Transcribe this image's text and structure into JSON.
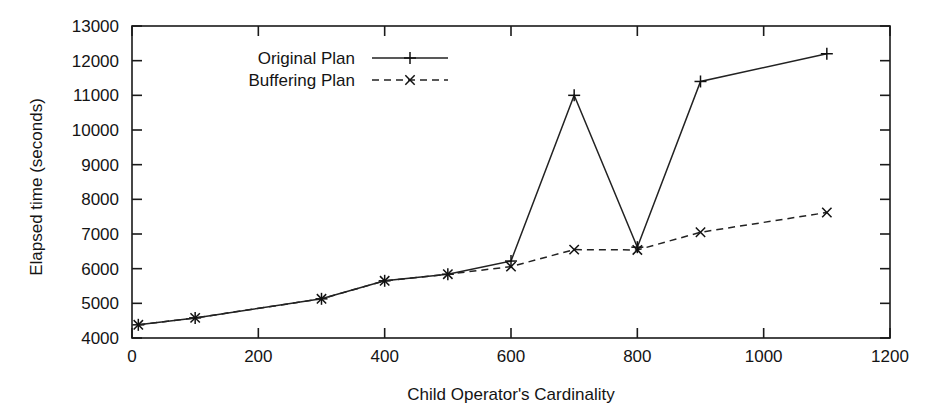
{
  "chart_data": {
    "type": "line",
    "title": "",
    "xlabel": "Child Operator's Cardinality",
    "ylabel": "Elapsed time (seconds)",
    "xlim": [
      0,
      1200
    ],
    "ylim": [
      4000,
      13000
    ],
    "xticks": [
      0,
      200,
      400,
      600,
      800,
      1000,
      1200
    ],
    "xtick_labels": [
      "0",
      "200",
      "400",
      "600",
      "800",
      "1000",
      "1200"
    ],
    "yticks": [
      4000,
      5000,
      6000,
      7000,
      8000,
      9000,
      10000,
      11000,
      12000,
      13000
    ],
    "ytick_labels": [
      "4000",
      "5000",
      "6000",
      "7000",
      "8000",
      "9000",
      "10000",
      "11000",
      "12000",
      "13000"
    ],
    "grid": false,
    "legend_position": "top-center",
    "series": [
      {
        "name": "Original Plan",
        "marker": "plus",
        "linestyle": "solid",
        "color": "#222222",
        "x": [
          10,
          100,
          300,
          400,
          500,
          600,
          700,
          800,
          900,
          1100
        ],
        "values": [
          4380,
          4580,
          5130,
          5650,
          5840,
          6220,
          11000,
          6620,
          11400,
          12200
        ]
      },
      {
        "name": "Buffering Plan",
        "marker": "cross",
        "linestyle": "dashed",
        "color": "#222222",
        "x": [
          10,
          100,
          300,
          400,
          500,
          600,
          700,
          800,
          900,
          1100
        ],
        "values": [
          4380,
          4580,
          5130,
          5650,
          5840,
          6060,
          6550,
          6540,
          7050,
          7620
        ]
      }
    ]
  },
  "legend": {
    "entries": [
      {
        "label": "Original Plan"
      },
      {
        "label": "Buffering Plan"
      }
    ]
  },
  "axes": {
    "x_title": "Child Operator's Cardinality",
    "y_title": "Elapsed time (seconds)"
  }
}
